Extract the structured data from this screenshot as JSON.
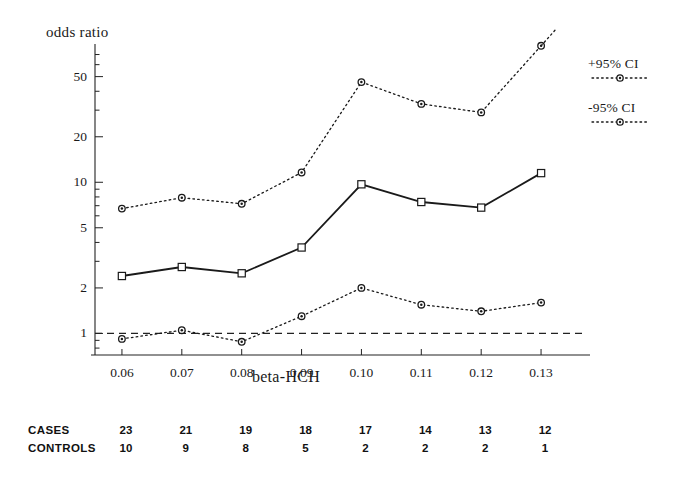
{
  "chart_data": {
    "type": "line",
    "title": "",
    "ylabel": "odds ratio",
    "xlabel": "beta-HCH",
    "x": [
      0.06,
      0.07,
      0.08,
      0.09,
      0.1,
      0.11,
      0.12,
      0.13
    ],
    "xticklabels": [
      "0.06",
      "0.07",
      "0.08",
      "0.09",
      "0.10",
      "0.11",
      "0.12",
      "0.13"
    ],
    "xlim": [
      0.0555,
      0.1345
    ],
    "yscale": "log",
    "ylim": [
      0.72,
      75
    ],
    "yticks": [
      1,
      2,
      5,
      10,
      20,
      50
    ],
    "yticklabels": [
      "1",
      "2",
      "5",
      "10",
      "20",
      "50"
    ],
    "grid": false,
    "legend_position": "right",
    "reference_line": {
      "y": 1.0,
      "style": "dashed",
      "label": ""
    },
    "series": [
      {
        "name": "odds ratio",
        "legend_shown": false,
        "style": "solid",
        "marker": "square",
        "values": [
          2.4,
          2.75,
          2.5,
          3.7,
          9.7,
          7.4,
          6.8,
          11.5
        ]
      },
      {
        "name": "+95% CI",
        "legend_shown": true,
        "style": "dotted",
        "marker": "circle",
        "values": [
          6.7,
          7.9,
          7.2,
          11.6,
          46.0,
          33.0,
          29.0,
          80.0
        ]
      },
      {
        "name": "-95% CI",
        "legend_shown": true,
        "style": "dotted",
        "marker": "circle",
        "values": [
          0.92,
          1.05,
          0.88,
          1.3,
          2.0,
          1.55,
          1.4,
          1.6
        ]
      }
    ],
    "counts_table": {
      "rows": [
        {
          "label": "CASES",
          "values": [
            23,
            21,
            19,
            18,
            17,
            14,
            13,
            12
          ]
        },
        {
          "label": "CONTROLS",
          "values": [
            10,
            9,
            8,
            5,
            2,
            2,
            2,
            1
          ]
        }
      ]
    }
  },
  "legend": {
    "entries": [
      {
        "label": "+95% CI"
      },
      {
        "label": "-95% CI"
      }
    ]
  },
  "axis": {
    "y_title": "odds ratio",
    "x_title": "beta-HCH"
  }
}
